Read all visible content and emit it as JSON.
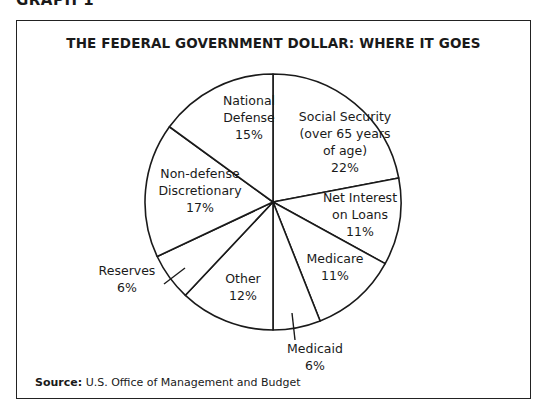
{
  "graph_label": "GRAPH 1",
  "source": {
    "label": "Source:",
    "text": "U.S. Office of Management and Budget"
  },
  "chart_data": {
    "type": "pie",
    "title": "THE FEDERAL GOVERNMENT DOLLAR: WHERE IT GOES",
    "start_angle_deg": 0,
    "direction": "clockwise",
    "slices": [
      {
        "name": "Social Security (over 65 years of age)",
        "value": 22,
        "label_lines": [
          "Social Security",
          "(over 65 years",
          "of age)",
          "22%"
        ],
        "label_pos": [
          328,
          100
        ],
        "outside": false
      },
      {
        "name": "Net Interest on Loans",
        "value": 11,
        "label_lines": [
          "Net Interest",
          "on Loans",
          "11%"
        ],
        "label_pos": [
          343,
          181
        ],
        "outside": false
      },
      {
        "name": "Medicare",
        "value": 11,
        "label_lines": [
          "Medicare",
          "11%"
        ],
        "label_pos": [
          318,
          242
        ],
        "outside": false
      },
      {
        "name": "Medicaid",
        "value": 6,
        "label_lines": [
          "Medicaid",
          "6%"
        ],
        "label_pos": [
          298,
          332
        ],
        "outside": true,
        "leader": [
          [
            275,
            292
          ],
          [
            278,
            319
          ]
        ]
      },
      {
        "name": "Other",
        "value": 12,
        "label_lines": [
          "Other",
          "12%"
        ],
        "label_pos": [
          226,
          262
        ],
        "outside": false
      },
      {
        "name": "Reserves",
        "value": 6,
        "label_lines": [
          "Reserves",
          "6%"
        ],
        "label_pos": [
          110,
          254
        ],
        "outside": true,
        "leader": [
          [
            147,
            263
          ],
          [
            168,
            247
          ]
        ]
      },
      {
        "name": "Non-defense Discretionary",
        "value": 17,
        "label_lines": [
          "Non-defense",
          "Discretionary",
          "17%"
        ],
        "label_pos": [
          183,
          157
        ],
        "outside": false
      },
      {
        "name": "National Defense",
        "value": 15,
        "label_lines": [
          "National",
          "Defense",
          "15%"
        ],
        "label_pos": [
          232,
          84
        ],
        "outside": false
      }
    ],
    "legend": null
  }
}
